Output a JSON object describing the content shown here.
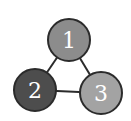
{
  "diagram": {
    "type": "graph",
    "nodes": [
      {
        "id": "1",
        "label": "1",
        "cx": 69,
        "cy": 40,
        "r": 21,
        "fill": "#8c8c8c"
      },
      {
        "id": "2",
        "label": "2",
        "cx": 35,
        "cy": 90,
        "r": 21,
        "fill": "#4d4d4d"
      },
      {
        "id": "3",
        "label": "3",
        "cx": 101,
        "cy": 93,
        "r": 21,
        "fill": "#a3a3a3"
      }
    ],
    "edges": [
      {
        "from": "1",
        "to": "2"
      },
      {
        "from": "1",
        "to": "3"
      },
      {
        "from": "2",
        "to": "3"
      }
    ],
    "stroke_color": "#2b2b2b",
    "label_color": "#ffffff"
  }
}
